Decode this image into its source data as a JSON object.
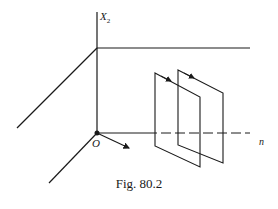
{
  "figure": {
    "caption": "Fig. 80.2",
    "labels": {
      "vertical_axis": "X",
      "vertical_axis_subscript": "2",
      "origin": "O",
      "horizontal_axis": "n"
    },
    "elements": [
      "vertical axis X2",
      "horizontal plane edge line",
      "oblique axis through origin",
      "dashed normal axis n",
      "unit normal arrow at origin",
      "two parallel rectangular planes with circulation arrows"
    ],
    "colors": {
      "line": "#1a1a1a",
      "background": "#ffffff"
    }
  }
}
